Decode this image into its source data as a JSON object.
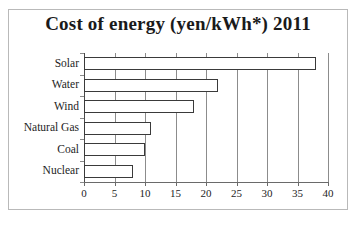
{
  "chart_data": {
    "type": "bar",
    "orientation": "horizontal",
    "title": "Cost of energy (yen/kWh*) 2011",
    "categories": [
      "Solar",
      "Water",
      "Wind",
      "Natural Gas",
      "Coal",
      "Nuclear"
    ],
    "values": [
      38,
      22,
      18,
      11,
      10,
      8
    ],
    "xlabel": "",
    "ylabel": "",
    "xlim": [
      0,
      40
    ],
    "xticks": [
      0,
      5,
      10,
      15,
      20,
      25,
      30,
      35,
      40
    ],
    "xtick_labels": [
      "0",
      "5",
      "10",
      "15",
      "20",
      "25",
      "30",
      "35",
      "40"
    ],
    "grid": true,
    "grid_axis": "x",
    "legend": null,
    "bar_fill_color": "#ffffff",
    "bar_edge_color": "#3a3a3a",
    "gridline_color": "#8c8c8c",
    "text_color": "#1d1d1d",
    "frame_color": "#b9b9b9"
  }
}
